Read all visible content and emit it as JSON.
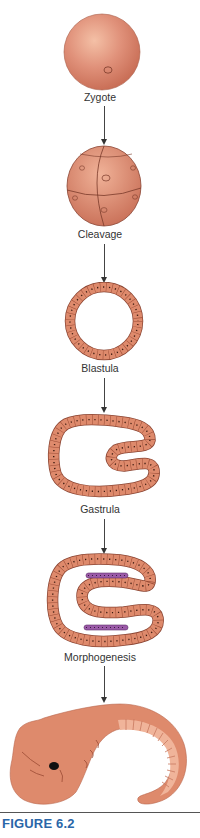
{
  "figure": {
    "caption": "FIGURE 6.2",
    "caption_color": "#2a66a8",
    "cell_color": "#de8a6c",
    "cell_outline": "#9a4a34",
    "mesoderm_color": "#9b5ba8",
    "stages": [
      {
        "id": "zygote",
        "label": "Zygote"
      },
      {
        "id": "cleavage",
        "label": "Cleavage"
      },
      {
        "id": "blastula",
        "label": "Blastula"
      },
      {
        "id": "gastrula",
        "label": "Gastrula"
      },
      {
        "id": "morphogenesis",
        "label": "Morphogenesis"
      },
      {
        "id": "embryo",
        "label": ""
      }
    ]
  }
}
